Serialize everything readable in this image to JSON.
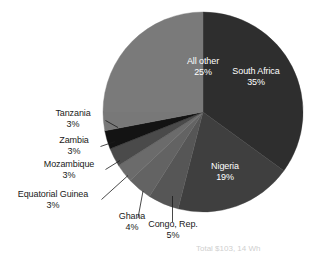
{
  "chart_data": {
    "type": "pie",
    "title": "",
    "subtitle": "",
    "xlabel": "",
    "ylabel": "",
    "legend_position": "none",
    "grid": false,
    "start_angle_deg": 0,
    "direction": "clockwise",
    "units": "percent",
    "categories": [
      "South Africa",
      "Nigeria",
      "Congo, Rep.",
      "Ghana",
      "Equatorial Guinea",
      "Mozambique",
      "Zambia",
      "Tanzania",
      "All other"
    ],
    "values": [
      35,
      19,
      5,
      4,
      3,
      3,
      3,
      3,
      25
    ],
    "value_labels": [
      "35%",
      "19%",
      "5%",
      "4%",
      "3%",
      "3%",
      "3%",
      "3%",
      "25%"
    ],
    "colors": [
      "#2e2e2e",
      "#3f3f3f",
      "#565656",
      "#636363",
      "#6b6b6b",
      "#4a4a4a",
      "#131313",
      "#787878",
      "#7a7a7a"
    ],
    "slices": [
      {
        "name": "South Africa",
        "value": 35,
        "label": "35%",
        "color": "#2e2e2e",
        "label_placement": "inside"
      },
      {
        "name": "Nigeria",
        "value": 19,
        "label": "19%",
        "color": "#3f3f3f",
        "label_placement": "inside"
      },
      {
        "name": "Congo, Rep.",
        "value": 5,
        "label": "5%",
        "color": "#565656",
        "label_placement": "outside"
      },
      {
        "name": "Ghana",
        "value": 4,
        "label": "4%",
        "color": "#636363",
        "label_placement": "outside"
      },
      {
        "name": "Equatorial Guinea",
        "value": 3,
        "label": "3%",
        "color": "#6b6b6b",
        "label_placement": "outside"
      },
      {
        "name": "Mozambique",
        "value": 3,
        "label": "3%",
        "color": "#4a4a4a",
        "label_placement": "outside"
      },
      {
        "name": "Zambia",
        "value": 3,
        "label": "3%",
        "color": "#131313",
        "label_placement": "outside"
      },
      {
        "name": "Tanzania",
        "value": 3,
        "label": "3%",
        "color": "#787878",
        "label_placement": "outside"
      },
      {
        "name": "All other",
        "value": 25,
        "label": "25%",
        "color": "#7a7a7a",
        "label_placement": "inside"
      }
    ]
  },
  "labels": {
    "south_africa": {
      "name": "South Africa",
      "pct": "35%"
    },
    "nigeria": {
      "name": "Nigeria",
      "pct": "19%"
    },
    "congo": {
      "name": "Congo, Rep.",
      "pct": "5%"
    },
    "ghana": {
      "name": "Ghana",
      "pct": "4%"
    },
    "equatorial_guinea": {
      "name": "Equatorial Guinea",
      "pct": "3%"
    },
    "mozambique": {
      "name": "Mozambique",
      "pct": "3%"
    },
    "zambia": {
      "name": "Zambia",
      "pct": "3%"
    },
    "tanzania": {
      "name": "Tanzania",
      "pct": "3%"
    },
    "all_other": {
      "name": "All other",
      "pct": "25%"
    }
  },
  "footnote": {
    "text": "Total $103, 14 Wh"
  }
}
